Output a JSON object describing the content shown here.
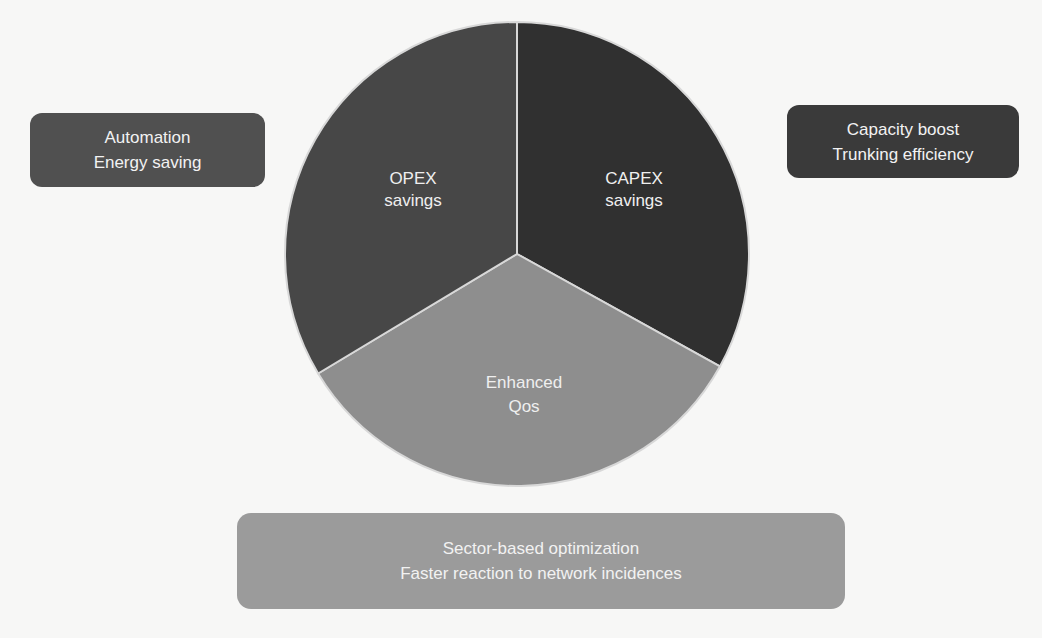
{
  "diagram": {
    "type": "pie-diagram",
    "slices": [
      {
        "label_lines": [
          "CAPEX",
          "savings"
        ],
        "color": "#303030",
        "start_deg": 0,
        "end_deg": 119
      },
      {
        "label_lines": [
          "Enhanced",
          "Qos"
        ],
        "color": "#8e8e8e",
        "start_deg": 119,
        "end_deg": 239
      },
      {
        "label_lines": [
          "OPEX",
          "savings"
        ],
        "color": "#474747",
        "start_deg": 239,
        "end_deg": 360
      }
    ],
    "callouts": {
      "left": {
        "lines": [
          "Automation",
          "Energy saving"
        ],
        "color": "#505050"
      },
      "right": {
        "lines": [
          "Capacity boost",
          "Trunking efficiency"
        ],
        "color": "#3a3a3a"
      },
      "bottom": {
        "lines": [
          "Sector-based optimization",
          "Faster reaction to network incidences"
        ],
        "color": "#9b9b9b"
      }
    },
    "divider_color": "#d8d8d8",
    "background": "#f7f7f6"
  }
}
